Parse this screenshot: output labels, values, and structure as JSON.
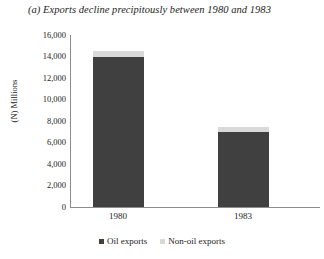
{
  "chart_data": {
    "type": "bar",
    "subtype": "stacked-column",
    "title": "(a) Exports decline precipitously between 1980 and 1983",
    "xlabel": "",
    "ylabel": "(N) Millions",
    "categories": [
      "1980",
      "1983"
    ],
    "ylim": [
      0,
      16000
    ],
    "ytick_labels": [
      "16,000",
      "14,000",
      "12,000",
      "10,000",
      "8,000",
      "6,000",
      "4,000",
      "2,000",
      "0"
    ],
    "ytick_values": [
      16000,
      14000,
      12000,
      10000,
      8000,
      6000,
      4000,
      2000,
      0
    ],
    "grid": false,
    "legend_position": "bottom",
    "series": [
      {
        "name": "Oil exports",
        "color": "#404040",
        "values": [
          14000,
          7000
        ]
      },
      {
        "name": "Non-oil exports",
        "color": "#d9d9d9",
        "values": [
          500,
          450
        ]
      }
    ]
  }
}
